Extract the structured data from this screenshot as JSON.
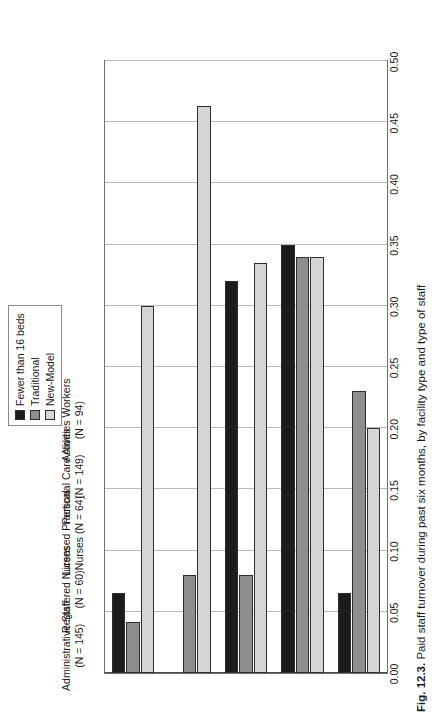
{
  "figure": {
    "caption_label": "Fig. 12.3.",
    "caption_text": "Paid staff turnover during past six months, by facility type and type of staff"
  },
  "legend": {
    "position": "top-right",
    "items": [
      {
        "label": "Fewer than 16 beds",
        "color": "#1c1c1c"
      },
      {
        "label": "Traditional",
        "color": "#8e8e8e"
      },
      {
        "label": "New-Model",
        "color": "#d5d5d5"
      }
    ]
  },
  "chart_data": {
    "type": "bar",
    "orientation": "horizontal-rotated",
    "title": "Paid staff turnover during past six months, by facility type and type of staff",
    "xlabel": "",
    "ylabel": "",
    "ylim": [
      0.0,
      0.5
    ],
    "grid": true,
    "tick_labels": [
      "0.00",
      "0.05",
      "0.10",
      "0.15",
      "0.20",
      "0.25",
      "0.30",
      "0.35",
      "0.40",
      "0.45",
      "0.50"
    ],
    "tick_values": [
      0.0,
      0.05,
      0.1,
      0.15,
      0.2,
      0.25,
      0.3,
      0.35,
      0.4,
      0.45,
      0.5
    ],
    "categories": [
      "Administrative Staff\n(N = 145)",
      "Registered Nurses\n(N = 60)",
      "Licensed Practical\nNurses (N = 64)",
      "Personal Care Aides\n(N = 149)",
      "Activities Workers\n(N = 94)"
    ],
    "category_lines": [
      [
        "Administrative Staff",
        "(N = 145)"
      ],
      [
        "Registered Nurses",
        "(N = 60)"
      ],
      [
        "Licensed Practical",
        "Nurses (N = 64)"
      ],
      [
        "Personal Care Aides",
        "(N = 149)"
      ],
      [
        "Activities Workers",
        "(N = 94)"
      ]
    ],
    "series": [
      {
        "name": "Fewer than 16 beds",
        "color": "#1c1c1c",
        "values": [
          0.065,
          0.0,
          0.32,
          0.35,
          0.065
        ]
      },
      {
        "name": "Traditional",
        "color": "#8e8e8e",
        "values": [
          0.042,
          0.08,
          0.08,
          0.34,
          0.23
        ]
      },
      {
        "name": "New-Model",
        "color": "#d5d5d5",
        "values": [
          0.3,
          0.463,
          0.335,
          0.34,
          0.2
        ]
      }
    ]
  }
}
